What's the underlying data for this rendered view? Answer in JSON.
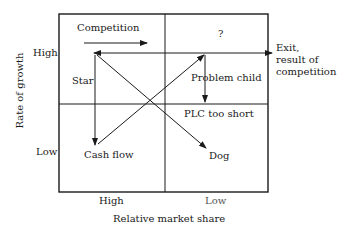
{
  "diagram": {
    "type": "boston-matrix",
    "x_axis": {
      "title": "Relative market share",
      "ticks": [
        "High",
        "Low"
      ]
    },
    "y_axis": {
      "title": "Rate of growth",
      "ticks": [
        "High",
        "Low"
      ]
    },
    "quadrants": {
      "top_left": "Star",
      "top_right": "?",
      "top_right_inner": "Problem child",
      "bottom_left": "Cash flow",
      "bottom_right": "Dog"
    },
    "annotations": {
      "competition": "Competition",
      "plc": "PLC too short",
      "exit_line1": "Exit,",
      "exit_line2": "result of",
      "exit_line3": "competition"
    },
    "colors": {
      "line": "#1a1a1a",
      "background": "#ffffff"
    }
  }
}
